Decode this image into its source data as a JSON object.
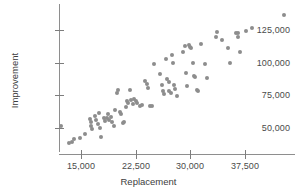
{
  "chart_data": {
    "type": "scatter",
    "title": "",
    "xlabel": "Replacement",
    "ylabel": "Improvement",
    "xticks": [
      15000,
      22500,
      30000,
      37500
    ],
    "xticklabels": [
      "15,000",
      "22,500",
      "30,000",
      "37,500"
    ],
    "yticks": [
      50000,
      75000,
      100000,
      125000
    ],
    "yticklabels": [
      "50,000",
      "75,000",
      "100,000",
      "125,000"
    ],
    "xlim": [
      11500,
      43800
    ],
    "ylim": [
      32000,
      140000
    ],
    "grid": false,
    "legend": null,
    "marker": {
      "shape": "circle",
      "color": "#8d8d8d",
      "size": 4
    },
    "axis_color": "#8e8e8e",
    "background": "#ffffff",
    "n_points": 97,
    "points": [
      {
        "x": 12200,
        "y": 51500
      },
      {
        "x": 13400,
        "y": 38500
      },
      {
        "x": 13700,
        "y": 39500
      },
      {
        "x": 14100,
        "y": 41500
      },
      {
        "x": 14800,
        "y": 42300
      },
      {
        "x": 15600,
        "y": 45500
      },
      {
        "x": 16200,
        "y": 57000
      },
      {
        "x": 16300,
        "y": 54500
      },
      {
        "x": 16400,
        "y": 51500
      },
      {
        "x": 16500,
        "y": 49500
      },
      {
        "x": 16900,
        "y": 59500
      },
      {
        "x": 17100,
        "y": 56000
      },
      {
        "x": 17300,
        "y": 53000
      },
      {
        "x": 17500,
        "y": 61500
      },
      {
        "x": 17600,
        "y": 50000
      },
      {
        "x": 17800,
        "y": 43500
      },
      {
        "x": 18100,
        "y": 58000
      },
      {
        "x": 18300,
        "y": 55500
      },
      {
        "x": 18500,
        "y": 57500
      },
      {
        "x": 18700,
        "y": 60500
      },
      {
        "x": 18900,
        "y": 56500
      },
      {
        "x": 19100,
        "y": 58500
      },
      {
        "x": 19300,
        "y": 55000
      },
      {
        "x": 19500,
        "y": 51500
      },
      {
        "x": 19700,
        "y": 63500
      },
      {
        "x": 19900,
        "y": 76500
      },
      {
        "x": 20100,
        "y": 79000
      },
      {
        "x": 20300,
        "y": 62500
      },
      {
        "x": 20500,
        "y": 60500
      },
      {
        "x": 20700,
        "y": 54000
      },
      {
        "x": 20900,
        "y": 54500
      },
      {
        "x": 21100,
        "y": 66000
      },
      {
        "x": 21300,
        "y": 70500
      },
      {
        "x": 21500,
        "y": 69000
      },
      {
        "x": 21700,
        "y": 79500
      },
      {
        "x": 21900,
        "y": 71500
      },
      {
        "x": 22100,
        "y": 68500
      },
      {
        "x": 22300,
        "y": 72500
      },
      {
        "x": 22500,
        "y": 70500
      },
      {
        "x": 22700,
        "y": 69500
      },
      {
        "x": 23100,
        "y": 66500
      },
      {
        "x": 23400,
        "y": 67500
      },
      {
        "x": 23800,
        "y": 86000
      },
      {
        "x": 24000,
        "y": 83500
      },
      {
        "x": 24200,
        "y": 80500
      },
      {
        "x": 24500,
        "y": 67000
      },
      {
        "x": 24700,
        "y": 66500
      },
      {
        "x": 25000,
        "y": 99000
      },
      {
        "x": 25900,
        "y": 91500
      },
      {
        "x": 26100,
        "y": 83000
      },
      {
        "x": 26300,
        "y": 78500
      },
      {
        "x": 26400,
        "y": 76000
      },
      {
        "x": 26600,
        "y": 102500
      },
      {
        "x": 26800,
        "y": 87500
      },
      {
        "x": 27000,
        "y": 85500
      },
      {
        "x": 27100,
        "y": 78500
      },
      {
        "x": 27300,
        "y": 76500
      },
      {
        "x": 27500,
        "y": 106000
      },
      {
        "x": 27600,
        "y": 99500
      },
      {
        "x": 27800,
        "y": 83000
      },
      {
        "x": 27900,
        "y": 80000
      },
      {
        "x": 28100,
        "y": 74500
      },
      {
        "x": 29000,
        "y": 108500
      },
      {
        "x": 29200,
        "y": 112500
      },
      {
        "x": 29400,
        "y": 92000
      },
      {
        "x": 29600,
        "y": 82500
      },
      {
        "x": 29800,
        "y": 113500
      },
      {
        "x": 30000,
        "y": 112000
      },
      {
        "x": 30100,
        "y": 111000
      },
      {
        "x": 30300,
        "y": 99500
      },
      {
        "x": 30500,
        "y": 90000
      },
      {
        "x": 30700,
        "y": 89000
      },
      {
        "x": 30900,
        "y": 79500
      },
      {
        "x": 31100,
        "y": 78500
      },
      {
        "x": 31500,
        "y": 114500
      },
      {
        "x": 32000,
        "y": 99000
      },
      {
        "x": 32300,
        "y": 88500
      },
      {
        "x": 33500,
        "y": 119500
      },
      {
        "x": 33700,
        "y": 123500
      },
      {
        "x": 34400,
        "y": 117500
      },
      {
        "x": 35100,
        "y": 111500
      },
      {
        "x": 35400,
        "y": 100000
      },
      {
        "x": 36300,
        "y": 123000
      },
      {
        "x": 36500,
        "y": 122500
      },
      {
        "x": 36600,
        "y": 119500
      },
      {
        "x": 36800,
        "y": 108500
      },
      {
        "x": 37600,
        "y": 124000
      },
      {
        "x": 38500,
        "y": 126500
      },
      {
        "x": 42800,
        "y": 136500
      }
    ]
  }
}
